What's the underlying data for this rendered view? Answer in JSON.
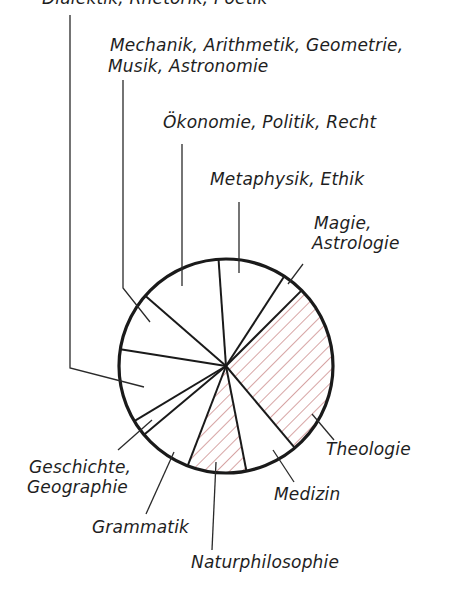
{
  "chart_data": {
    "type": "pie",
    "title": "",
    "center": [
      226,
      366
    ],
    "radius": 107,
    "hatch_color": "#b04848",
    "outline_color": "#1a1a1a",
    "slices": [
      {
        "label": "Metaphysik, Ethik",
        "start_deg": -94,
        "end_deg": -57,
        "hatched": false
      },
      {
        "label": "Magie, Astrologie",
        "start_deg": -57,
        "end_deg": -45,
        "hatched": false
      },
      {
        "label": "Theologie",
        "start_deg": -45,
        "end_deg": 50,
        "hatched": true
      },
      {
        "label": "Medizin",
        "start_deg": 50,
        "end_deg": 79,
        "hatched": false
      },
      {
        "label": "Naturphilosophie",
        "start_deg": 79,
        "end_deg": 111,
        "hatched": true
      },
      {
        "label": "Grammatik",
        "start_deg": 111,
        "end_deg": 140,
        "hatched": false
      },
      {
        "label": "Geschichte, Geographie",
        "start_deg": 140,
        "end_deg": 149,
        "hatched": false
      },
      {
        "label": "(top label, clipped)",
        "start_deg": 149,
        "end_deg": 189,
        "hatched": false
      },
      {
        "label": "Mechanik, Arithmetik, Geometrie, Musik, Astronomie",
        "start_deg": 189,
        "end_deg": 221,
        "hatched": false
      },
      {
        "label": "Ökonomie, Politik, Recht",
        "start_deg": 221,
        "end_deg": 266,
        "hatched": false
      }
    ],
    "approx_share_deg": {
      "Metaphysik, Ethik": 37,
      "Magie, Astrologie": 12,
      "Theologie": 95,
      "Medizin": 29,
      "Naturphilosophie": 32,
      "Grammatik": 29,
      "Geschichte, Geographie": 9,
      "(top label, clipped)": 40,
      "Mechanik, Arithmetik, Geometrie, Musik, Astronomie": 32,
      "Ökonomie, Politik, Recht": 45
    }
  },
  "labels": {
    "top_clipped": "Dialektik, Rhetorik, Poetik",
    "mechanik_line1": "Mechanik, Arithmetik, Geometrie,",
    "mechanik_line2": "Musik, Astronomie",
    "oekonomie": "Ökonomie, Politik, Recht",
    "metaphysik": "Metaphysik, Ethik",
    "magie_line1": "Magie,",
    "magie_line2": "Astrologie",
    "theologie": "Theologie",
    "geschichte_line1": "Geschichte,",
    "geschichte_line2": "Geographie",
    "medizin": "Medizin",
    "grammatik": "Grammatik",
    "naturphilosophie": "Naturphilosophie"
  }
}
